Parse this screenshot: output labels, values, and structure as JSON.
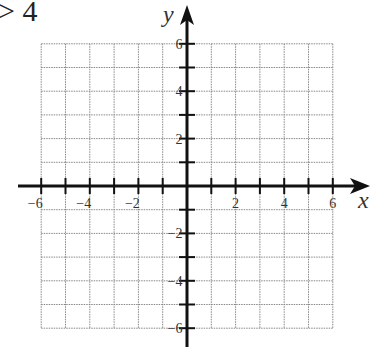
{
  "fragment_text": "> 4",
  "graph": {
    "type": "coordinate-plane",
    "x_axis_label": "x",
    "y_axis_label": "y",
    "x_range": [
      -6,
      6
    ],
    "y_range": [
      -6,
      6
    ],
    "grid_step": 1,
    "x_tick_labels": [
      "-6",
      "-4",
      "-2",
      "2",
      "4",
      "6"
    ],
    "y_tick_labels": [
      "6",
      "4",
      "2",
      "-2",
      "-4",
      "-6"
    ]
  },
  "colors": {
    "axis": "#111111",
    "grid": "#888888",
    "text": "#333333"
  }
}
